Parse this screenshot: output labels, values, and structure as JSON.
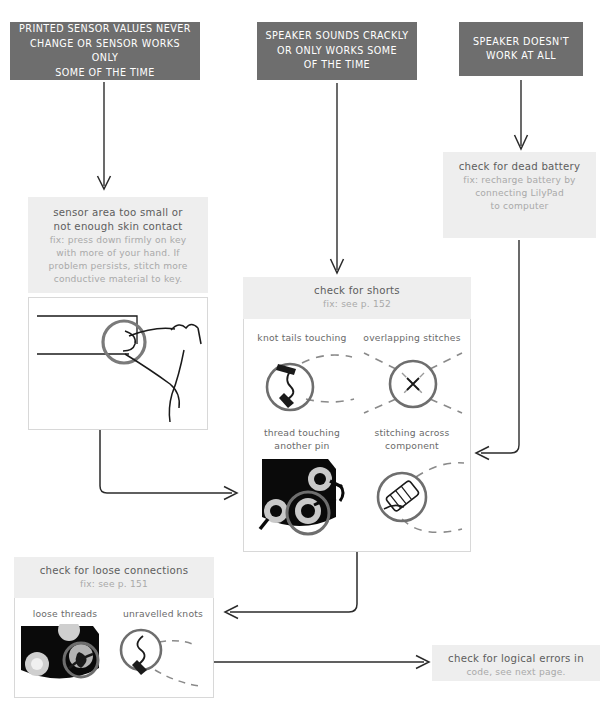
{
  "page": {
    "kind": "troubleshooting-flowchart",
    "width": 611,
    "height": 708,
    "background": "#ffffff",
    "colors": {
      "problem_box_fill": "#6e6e6e",
      "problem_box_text": "#ffffff",
      "solution_box_fill": "#eeeeee",
      "solution_title_text": "#5d5d5d",
      "solution_fix_text": "#a9a9a9",
      "arrow": "#2b2b2b",
      "illustration_ink": "#1a1a1a",
      "illustration_highlight": "#6e6e6e",
      "board_black": "#0a0a0a",
      "pad_gray": "#b8b8b8"
    }
  },
  "problems": [
    {
      "id": "sensor-problem",
      "lines": [
        "PRINTED SENSOR VALUES NEVER",
        "CHANGE OR SENSOR WORKS ONLY",
        "SOME OF THE TIME"
      ]
    },
    {
      "id": "speaker-crackly-problem",
      "lines": [
        "SPEAKER SOUNDS CRACKLY",
        "OR ONLY WORKS SOME",
        "OF THE TIME"
      ]
    },
    {
      "id": "speaker-dead-problem",
      "lines": [
        "SPEAKER DOESN'T",
        "WORK AT ALL"
      ]
    }
  ],
  "solutions": {
    "dead_battery": {
      "title": "check for dead battery",
      "fix_lines": [
        "fix: recharge battery by",
        "connecting LilyPad",
        "to computer"
      ]
    },
    "sensor_area": {
      "title_lines": [
        "sensor area too small or",
        "not enough skin contact"
      ],
      "fix_lines": [
        "fix: press down firmly on key",
        "with more of your hand. If",
        "problem persists, stitch more",
        "conductive material to key."
      ]
    },
    "shorts": {
      "title": "check for shorts",
      "fix": "fix: see p. 152",
      "figures": [
        {
          "id": "knot-tails-touching",
          "caption_lines": [
            "knot tails touching"
          ]
        },
        {
          "id": "overlapping-stitches",
          "caption_lines": [
            "overlapping stitches"
          ]
        },
        {
          "id": "thread-touching-another-pin",
          "caption_lines": [
            "thread touching",
            "another pin"
          ]
        },
        {
          "id": "stitching-across-component",
          "caption_lines": [
            "stitching across",
            "component"
          ]
        }
      ]
    },
    "loose_connections": {
      "title": "check for loose connections",
      "fix": "fix: see p. 151",
      "figures": [
        {
          "id": "loose-threads",
          "caption_lines": [
            "loose threads"
          ]
        },
        {
          "id": "unravelled-knots",
          "caption_lines": [
            "unravelled knots"
          ]
        }
      ]
    },
    "logical_errors": {
      "lines": [
        "check for logical errors in",
        "code, see next page."
      ],
      "title_part": "check for logical errors in",
      "fix_part": "code, see next page."
    }
  },
  "connections": [
    {
      "id": "sensor-problem-to-sensor-area",
      "from": "sensor-problem",
      "to": "sensor_area",
      "shape": "vertical"
    },
    {
      "id": "speaker-crackly-to-shorts",
      "from": "speaker-crackly-problem",
      "to": "shorts",
      "shape": "vertical"
    },
    {
      "id": "speaker-dead-to-dead-battery",
      "from": "speaker-dead-problem",
      "to": "dead_battery",
      "shape": "vertical"
    },
    {
      "id": "sensor-area-to-shorts",
      "from": "sensor_area",
      "to": "shorts",
      "shape": "elbow-down-right"
    },
    {
      "id": "dead-battery-to-shorts",
      "from": "dead_battery",
      "to": "shorts",
      "shape": "elbow-down-left"
    },
    {
      "id": "shorts-to-loose-connections",
      "from": "shorts",
      "to": "loose_connections",
      "shape": "elbow-down-left"
    },
    {
      "id": "loose-connections-to-logical-errors",
      "from": "loose_connections",
      "to": "logical_errors",
      "shape": "horizontal"
    }
  ]
}
